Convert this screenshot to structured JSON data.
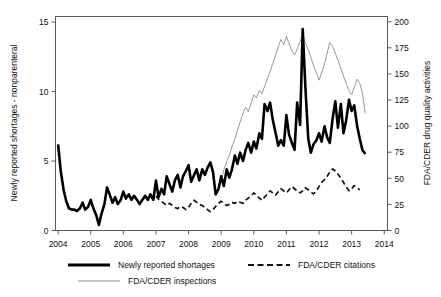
{
  "chart_data": {
    "type": "line",
    "title": "",
    "subtitle": "",
    "xlabel": "",
    "ylabel": "Newly reported shortages - nonparenteral",
    "y2label": "FDA/CDER drug quality activities",
    "grid": false,
    "legend_position": "bottom",
    "xlim": [
      2003.92,
      2014.1
    ],
    "ylim": [
      0,
      15.4
    ],
    "y2lim": [
      0,
      205
    ],
    "xticks": [
      "2004",
      "2005",
      "2006",
      "2007",
      "2008",
      "2009",
      "2010",
      "2011",
      "2012",
      "2013",
      "2014"
    ],
    "yticks": [
      "0",
      "5",
      "10",
      "15"
    ],
    "y2ticks": [
      "0",
      "25",
      "50",
      "75",
      "100",
      "125",
      "150",
      "175",
      "200"
    ],
    "series": [
      {
        "name": "Newly reported shortages",
        "axis": "left",
        "style": "solid-thick",
        "color": "#000000",
        "x": [
          2004.0,
          2004.08,
          2004.17,
          2004.25,
          2004.33,
          2004.42,
          2004.5,
          2004.58,
          2004.67,
          2004.75,
          2004.83,
          2004.92,
          2005.0,
          2005.08,
          2005.17,
          2005.25,
          2005.33,
          2005.42,
          2005.5,
          2005.58,
          2005.67,
          2005.75,
          2005.83,
          2005.92,
          2006.0,
          2006.08,
          2006.17,
          2006.25,
          2006.33,
          2006.42,
          2006.5,
          2006.58,
          2006.67,
          2006.75,
          2006.83,
          2006.92,
          2007.0,
          2007.08,
          2007.17,
          2007.25,
          2007.33,
          2007.42,
          2007.5,
          2007.58,
          2007.67,
          2007.75,
          2007.83,
          2007.92,
          2008.0,
          2008.08,
          2008.17,
          2008.25,
          2008.33,
          2008.42,
          2008.5,
          2008.58,
          2008.67,
          2008.75,
          2008.83,
          2008.92,
          2009.0,
          2009.08,
          2009.17,
          2009.25,
          2009.33,
          2009.42,
          2009.5,
          2009.58,
          2009.67,
          2009.75,
          2009.83,
          2009.92,
          2010.0,
          2010.08,
          2010.17,
          2010.25,
          2010.33,
          2010.42,
          2010.5,
          2010.58,
          2010.67,
          2010.75,
          2010.83,
          2010.92,
          2011.0,
          2011.08,
          2011.17,
          2011.25,
          2011.33,
          2011.42,
          2011.5,
          2011.58,
          2011.67,
          2011.75,
          2011.83,
          2011.92,
          2012.0,
          2012.08,
          2012.17,
          2012.25,
          2012.33,
          2012.42,
          2012.5,
          2012.58,
          2012.67,
          2012.75,
          2012.83,
          2012.92,
          2013.0,
          2013.08,
          2013.17,
          2013.25,
          2013.33,
          2013.42
        ],
        "values": [
          6.2,
          4.3,
          2.9,
          2.1,
          1.6,
          1.5,
          1.5,
          1.4,
          1.6,
          2.0,
          1.5,
          1.7,
          2.2,
          1.6,
          1.1,
          0.4,
          1.2,
          1.9,
          3.1,
          2.6,
          2.0,
          2.4,
          1.9,
          2.2,
          2.8,
          2.3,
          2.6,
          2.2,
          2.5,
          2.2,
          1.9,
          2.2,
          2.5,
          2.2,
          2.6,
          2.2,
          3.6,
          2.4,
          3.0,
          2.6,
          3.9,
          3.3,
          2.8,
          3.6,
          4.0,
          3.1,
          3.9,
          4.3,
          4.7,
          3.5,
          4.0,
          4.4,
          3.6,
          4.4,
          4.0,
          4.5,
          4.9,
          4.2,
          2.6,
          3.0,
          3.9,
          3.2,
          4.4,
          3.8,
          4.4,
          5.4,
          4.8,
          5.6,
          5.0,
          5.8,
          6.3,
          5.6,
          6.4,
          5.9,
          7.0,
          6.6,
          9.1,
          8.6,
          9.2,
          8.0,
          7.0,
          6.1,
          6.5,
          6.1,
          8.3,
          6.9,
          6.3,
          5.8,
          9.2,
          7.6,
          14.5,
          10.4,
          6.6,
          5.6,
          6.2,
          6.5,
          7.0,
          6.4,
          7.5,
          6.7,
          6.3,
          8.1,
          9.3,
          7.4,
          9.1,
          7.0,
          7.9,
          9.4,
          8.6,
          9.0,
          7.5,
          6.6,
          5.8,
          5.5
        ]
      },
      {
        "name": "FDA/CDER inspections",
        "axis": "right",
        "style": "solid-thin",
        "color": "#8d8d8d",
        "x": [
          2009.0,
          2009.08,
          2009.17,
          2009.25,
          2009.33,
          2009.42,
          2009.5,
          2009.58,
          2009.67,
          2009.75,
          2009.83,
          2009.92,
          2010.0,
          2010.08,
          2010.17,
          2010.25,
          2010.33,
          2010.42,
          2010.5,
          2010.58,
          2010.67,
          2010.75,
          2010.83,
          2010.92,
          2011.0,
          2011.08,
          2011.17,
          2011.25,
          2011.33,
          2011.42,
          2011.5,
          2011.58,
          2011.67,
          2011.75,
          2011.83,
          2011.92,
          2012.0,
          2012.08,
          2012.17,
          2012.25,
          2012.33,
          2012.42,
          2012.5,
          2012.58,
          2012.67,
          2012.75,
          2012.83,
          2012.92,
          2013.0,
          2013.08,
          2013.17,
          2013.25,
          2013.33,
          2013.42
        ],
        "values": [
          47,
          58,
          66,
          72,
          80,
          88,
          96,
          104,
          112,
          118,
          114,
          122,
          130,
          127,
          134,
          131,
          138,
          146,
          152,
          160,
          168,
          176,
          183,
          178,
          186,
          179,
          172,
          168,
          174,
          181,
          188,
          180,
          173,
          166,
          158,
          151,
          144,
          151,
          160,
          170,
          180,
          176,
          170,
          163,
          155,
          148,
          141,
          134,
          130,
          137,
          145,
          141,
          132,
          112
        ]
      },
      {
        "name": "FDA/CDER citations",
        "axis": "right",
        "style": "dashed",
        "color": "#111111",
        "x": [
          2007.0,
          2007.08,
          2007.17,
          2007.25,
          2007.33,
          2007.42,
          2007.5,
          2007.58,
          2007.67,
          2007.75,
          2007.83,
          2007.92,
          2008.0,
          2008.08,
          2008.17,
          2008.25,
          2008.33,
          2008.42,
          2008.5,
          2008.58,
          2008.67,
          2008.75,
          2008.83,
          2008.92,
          2009.0,
          2009.08,
          2009.17,
          2009.25,
          2009.33,
          2009.42,
          2009.5,
          2009.58,
          2009.67,
          2009.75,
          2009.83,
          2009.92,
          2010.0,
          2010.08,
          2010.17,
          2010.25,
          2010.33,
          2010.42,
          2010.5,
          2010.58,
          2010.67,
          2010.75,
          2010.83,
          2010.92,
          2011.0,
          2011.08,
          2011.17,
          2011.25,
          2011.33,
          2011.42,
          2011.5,
          2011.58,
          2011.67,
          2011.75,
          2011.83,
          2011.92,
          2012.0,
          2012.08,
          2012.17,
          2012.25,
          2012.33,
          2012.42,
          2012.5,
          2012.58,
          2012.67,
          2012.75,
          2012.83,
          2012.92,
          2013.0,
          2013.08,
          2013.17,
          2013.25
        ],
        "values": [
          33,
          30,
          28,
          26,
          24,
          26,
          24,
          22,
          21,
          23,
          22,
          20,
          22,
          26,
          29,
          27,
          25,
          24,
          22,
          20,
          18,
          20,
          23,
          26,
          28,
          26,
          24,
          25,
          27,
          26,
          28,
          27,
          26,
          29,
          31,
          33,
          36,
          34,
          31,
          29,
          32,
          35,
          38,
          36,
          34,
          37,
          40,
          38,
          36,
          39,
          42,
          40,
          38,
          36,
          38,
          41,
          39,
          37,
          35,
          38,
          42,
          46,
          49,
          52,
          56,
          59,
          57,
          54,
          50,
          46,
          42,
          38,
          40,
          43,
          41,
          39
        ]
      }
    ]
  },
  "legend": {
    "items": [
      {
        "label": "Newly reported shortages",
        "style": "solid-thick"
      },
      {
        "label": "FDA/CDER citations",
        "style": "dashed"
      },
      {
        "label": "FDA/CDER inspections",
        "style": "solid-thin"
      }
    ]
  },
  "colors": {
    "shortages": "#000000",
    "inspections": "#8d8d8d",
    "citations": "#111111",
    "frame": "#5a5a5a",
    "background": "#ffffff"
  }
}
